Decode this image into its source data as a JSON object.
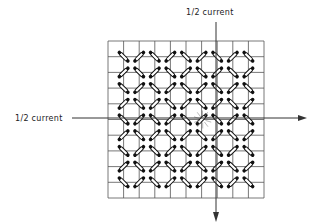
{
  "diagram": {
    "labels": {
      "top_wire": "1/2 current",
      "left_wire": "1/2 current"
    },
    "grid": {
      "rows": 10,
      "cols": 10
    },
    "selected_core": {
      "row": 5,
      "col": 6
    },
    "colors": {
      "line": "#555555",
      "core": "#111111",
      "background": "#ffffff"
    }
  }
}
